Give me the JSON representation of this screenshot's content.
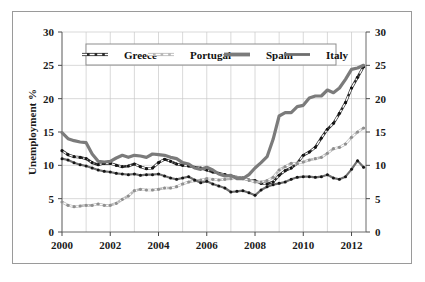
{
  "chart_data": {
    "type": "line",
    "title": "",
    "xlabel": "",
    "ylabel": "Unemployment %",
    "xlim": [
      2000.0,
      2012.6
    ],
    "ylim": [
      0,
      30
    ],
    "ytick_step": 5,
    "xtick_step": 2,
    "grid": true,
    "grid_minor_x_step": 1,
    "legend_position": "top-center-inside",
    "dual_y_axis": true,
    "ytick_labels": [
      "0",
      "5",
      "10",
      "15",
      "20",
      "25",
      "30"
    ],
    "ytick_values": [
      0,
      5,
      10,
      15,
      20,
      25,
      30
    ],
    "ytick_labels_right": [
      "0",
      "5",
      "10",
      "15",
      "20",
      "25",
      "30"
    ],
    "xtick_labels": [
      "2000",
      "2002",
      "2004",
      "2006",
      "2008",
      "2010",
      "2012"
    ],
    "xtick_values": [
      2000,
      2002,
      2004,
      2006,
      2008,
      2010,
      2012
    ],
    "x": [
      2000.0,
      2000.25,
      2000.5,
      2000.75,
      2001.0,
      2001.25,
      2001.5,
      2001.75,
      2002.0,
      2002.25,
      2002.5,
      2002.75,
      2003.0,
      2003.25,
      2003.5,
      2003.75,
      2004.0,
      2004.25,
      2004.5,
      2004.75,
      2005.0,
      2005.25,
      2005.5,
      2005.75,
      2006.0,
      2006.25,
      2006.5,
      2006.75,
      2007.0,
      2007.25,
      2007.5,
      2007.75,
      2008.0,
      2008.25,
      2008.5,
      2008.75,
      2009.0,
      2009.25,
      2009.5,
      2009.75,
      2010.0,
      2010.25,
      2010.5,
      2010.75,
      2011.0,
      2011.25,
      2011.5,
      2011.75,
      2012.0,
      2012.25,
      2012.5
    ],
    "series": [
      {
        "name": "Greece",
        "color": "#2b2b2b",
        "style": "dashed-marker",
        "values": [
          12.2,
          11.6,
          11.3,
          11.2,
          11.0,
          10.4,
          10.1,
          10.3,
          10.3,
          10.0,
          9.8,
          9.9,
          10.2,
          9.8,
          9.5,
          9.6,
          10.4,
          10.9,
          10.6,
          10.2,
          10.0,
          9.9,
          9.7,
          9.6,
          9.3,
          9.0,
          8.8,
          8.6,
          8.4,
          8.2,
          8.1,
          7.8,
          7.7,
          7.3,
          7.2,
          7.5,
          8.5,
          9.2,
          9.6,
          10.3,
          11.5,
          12.0,
          12.7,
          14.1,
          15.4,
          16.3,
          17.8,
          19.4,
          21.6,
          23.2,
          24.8
        ]
      },
      {
        "name": "Portugal",
        "color": "#b8b8b8",
        "style": "dashed-marker",
        "values": [
          4.5,
          4.0,
          3.8,
          3.9,
          4.0,
          4.0,
          4.2,
          4.0,
          4.0,
          4.3,
          4.9,
          5.4,
          6.2,
          6.4,
          6.3,
          6.3,
          6.4,
          6.6,
          6.6,
          6.8,
          7.2,
          7.5,
          7.7,
          7.8,
          8.0,
          7.9,
          7.8,
          7.9,
          8.0,
          8.2,
          8.0,
          7.8,
          7.5,
          7.5,
          7.7,
          8.2,
          9.3,
          9.8,
          10.3,
          10.3,
          10.5,
          10.8,
          11.0,
          11.2,
          11.8,
          12.5,
          12.7,
          13.2,
          14.2,
          15.0,
          15.6
        ]
      },
      {
        "name": "Spain",
        "color": "#7b7b7b",
        "style": "thick-solid",
        "values": [
          14.9,
          14.0,
          13.7,
          13.5,
          13.4,
          11.7,
          10.6,
          10.5,
          10.6,
          11.1,
          11.5,
          11.2,
          11.5,
          11.4,
          11.2,
          11.7,
          11.6,
          11.5,
          11.2,
          11.0,
          10.4,
          10.2,
          9.6,
          9.4,
          9.7,
          9.3,
          8.7,
          8.4,
          8.5,
          8.0,
          8.0,
          8.6,
          9.6,
          10.4,
          11.3,
          13.9,
          17.4,
          17.9,
          17.9,
          18.8,
          19.0,
          20.1,
          20.4,
          20.4,
          21.3,
          20.9,
          21.6,
          22.9,
          24.4,
          24.6,
          25.0
        ]
      },
      {
        "name": "Italy",
        "color": "#6e6e6e",
        "style": "thin-marker",
        "values": [
          11.0,
          10.8,
          10.4,
          10.1,
          9.9,
          9.6,
          9.3,
          9.1,
          9.0,
          8.8,
          8.7,
          8.6,
          8.7,
          8.5,
          8.6,
          8.6,
          8.7,
          8.4,
          8.1,
          7.9,
          8.1,
          8.3,
          7.8,
          7.4,
          7.6,
          7.2,
          6.9,
          6.6,
          6.0,
          6.1,
          6.2,
          5.9,
          5.5,
          6.3,
          6.8,
          7.1,
          7.3,
          7.5,
          7.9,
          8.2,
          8.3,
          8.3,
          8.2,
          8.3,
          8.6,
          8.1,
          7.9,
          8.3,
          9.4,
          10.7,
          9.7
        ]
      }
    ]
  },
  "legend": {
    "items": [
      {
        "label": "Greece"
      },
      {
        "label": "Portugal"
      },
      {
        "label": "Spain"
      },
      {
        "label": "Italy"
      }
    ]
  }
}
